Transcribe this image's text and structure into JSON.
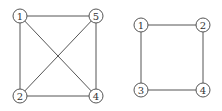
{
  "graphs": [
    {
      "name": "left-graph",
      "nodes": [
        {
          "id": "1",
          "x": 20,
          "y": 16
        },
        {
          "id": "5",
          "x": 96,
          "y": 16
        },
        {
          "id": "2",
          "x": 20,
          "y": 96
        },
        {
          "id": "4",
          "x": 96,
          "y": 96
        }
      ],
      "edges": [
        [
          "1",
          "5"
        ],
        [
          "1",
          "2"
        ],
        [
          "1",
          "4"
        ],
        [
          "5",
          "2"
        ],
        [
          "5",
          "4"
        ],
        [
          "2",
          "4"
        ]
      ]
    },
    {
      "name": "right-graph",
      "nodes": [
        {
          "id": "1",
          "x": 141,
          "y": 25
        },
        {
          "id": "2",
          "x": 203,
          "y": 25
        },
        {
          "id": "3",
          "x": 141,
          "y": 90
        },
        {
          "id": "4",
          "x": 203,
          "y": 90
        }
      ],
      "edges": [
        [
          "1",
          "2"
        ],
        [
          "1",
          "3"
        ],
        [
          "2",
          "4"
        ],
        [
          "3",
          "4"
        ]
      ]
    }
  ],
  "style": {
    "node_radius": 7,
    "stroke": "#555555"
  }
}
